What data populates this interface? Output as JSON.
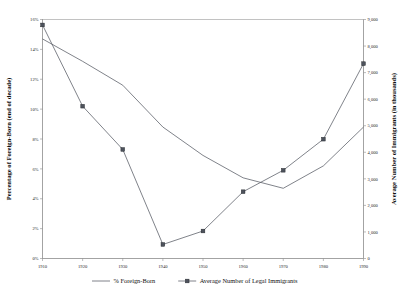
{
  "chart_data": {
    "type": "line",
    "title": "",
    "xlabel": "",
    "categories": [
      "1910",
      "1920",
      "1930",
      "1940",
      "1950",
      "1960",
      "1970",
      "1980",
      "1990"
    ],
    "x": [
      1910,
      1920,
      1930,
      1940,
      1950,
      1960,
      1970,
      1980,
      1990
    ],
    "grid": false,
    "legend_position": "bottom",
    "axes": {
      "x": {
        "min": 1910,
        "max": 1990,
        "tick_labels": [
          "1910",
          "1920",
          "1930",
          "1940",
          "1950",
          "1960",
          "1970",
          "1980",
          "1990"
        ],
        "tick_values": [
          1910,
          1920,
          1930,
          1940,
          1950,
          1960,
          1970,
          1980,
          1990
        ]
      },
      "left": {
        "label": "Percentage of Foreign-Born (end of decade)",
        "min": 0,
        "max": 16,
        "tick_labels": [
          "0%",
          "2%",
          "4%",
          "6%",
          "8%",
          "10%",
          "12%",
          "14%",
          "16%"
        ],
        "tick_values": [
          0,
          2,
          4,
          6,
          8,
          10,
          12,
          14,
          16
        ],
        "unit": "%"
      },
      "right": {
        "label": "Average Number of Immigrants (in thousands)",
        "min": 0,
        "max": 9000,
        "tick_labels": [
          "0",
          "1,000",
          "2,000",
          "3,000",
          "4,000",
          "5,000",
          "6,000",
          "7,000",
          "8,000",
          "9,000"
        ],
        "tick_values": [
          0,
          1000,
          2000,
          3000,
          4000,
          5000,
          6000,
          7000,
          8000,
          9000
        ],
        "unit": "thousands"
      }
    },
    "series": [
      {
        "name": "% Foreign-Born",
        "axis": "left",
        "marker": "none",
        "values": [
          14.7,
          13.2,
          11.6,
          8.8,
          6.9,
          5.4,
          4.7,
          6.2,
          8.8
        ]
      },
      {
        "name": "Average  Number of Legal Immigrants",
        "axis": "right",
        "marker": "square",
        "values": [
          8795,
          5735,
          4107,
          528,
          1035,
          2515,
          3322,
          4493,
          7338
        ]
      }
    ]
  },
  "legend": {
    "entries": [
      {
        "label": "% Foreign-Born",
        "marker": "line"
      },
      {
        "label": "Average  Number of Legal Immigrants",
        "marker": "line-square"
      }
    ]
  }
}
